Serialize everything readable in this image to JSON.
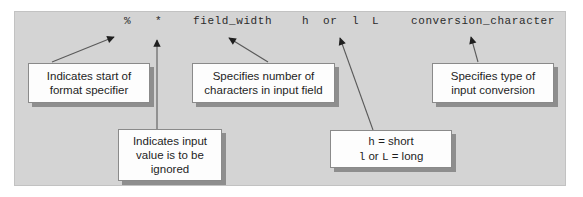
{
  "diagram": {
    "panel_color": "#d4d4d4",
    "box_color": "#fdfdfd",
    "shadow_color": "#8e8e8e",
    "line_color": "#5a5a5a"
  },
  "format_string": {
    "tokens": [
      {
        "id": "percent",
        "text": "%",
        "x": 124
      },
      {
        "id": "asterisk",
        "text": "*",
        "x": 155
      },
      {
        "id": "field_width",
        "text": "field_width",
        "x": 193
      },
      {
        "id": "h",
        "text": "h",
        "x": 302
      },
      {
        "id": "or",
        "text": "or",
        "x": 323
      },
      {
        "id": "l",
        "text": "l",
        "x": 352
      },
      {
        "id": "L",
        "text": "L",
        "x": 372
      },
      {
        "id": "conversion_character",
        "text": "conversion_character",
        "x": 411
      }
    ]
  },
  "callouts": {
    "percent": {
      "lines": [
        "Indicates start of",
        "format specifier"
      ]
    },
    "field_width": {
      "lines": [
        "Specifies number of",
        "characters in input field"
      ]
    },
    "conversion": {
      "lines": [
        "Specifies type of",
        "input conversion"
      ]
    },
    "asterisk": {
      "lines": [
        "Indicates input",
        "value is to be",
        "ignored"
      ]
    },
    "length_modifier": {
      "line1_mono": "h",
      "line1_rest": " = short",
      "line2_mono_a": "l",
      "line2_mid": " or ",
      "line2_mono_b": "L",
      "line2_rest": " = long"
    }
  }
}
